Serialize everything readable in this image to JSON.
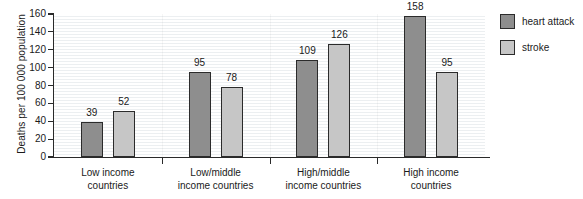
{
  "chart_data": {
    "type": "bar",
    "title": "",
    "subtitle": "",
    "xlabel": "",
    "ylabel": "Deaths per 100 000 population",
    "ylim": [
      0,
      160
    ],
    "yticks": [
      0,
      20,
      40,
      60,
      80,
      100,
      120,
      140,
      160
    ],
    "ytick_labels": [
      "0",
      "20",
      "40",
      "60",
      "80",
      "100",
      "120",
      "140",
      "160"
    ],
    "grid": "horizontal",
    "legend_position": "right",
    "categories": [
      "Low income countries",
      "Low/middle income countries",
      "High/middle income countries",
      "High income countries"
    ],
    "category_lines": [
      [
        "Low income",
        "countries"
      ],
      [
        "Low/middle",
        "income countries"
      ],
      [
        "High/middle",
        "income countries"
      ],
      [
        "High income",
        "countries"
      ]
    ],
    "series": [
      {
        "name": "heart attack",
        "color": "#8e8e8e",
        "values": [
          39,
          95,
          109,
          158
        ],
        "value_labels": [
          "39",
          "95",
          "109",
          "158"
        ]
      },
      {
        "name": "stroke",
        "color": "#c6c6c6",
        "values": [
          52,
          78,
          126,
          95
        ],
        "value_labels": [
          "52",
          "78",
          "126",
          "95"
        ]
      }
    ]
  },
  "legend": {
    "items": [
      {
        "label": "heart attack",
        "color": "#8e8e8e"
      },
      {
        "label": "stroke",
        "color": "#c6c6c6"
      }
    ]
  },
  "axes": {
    "y_title": "Deaths per 100 000 population"
  }
}
